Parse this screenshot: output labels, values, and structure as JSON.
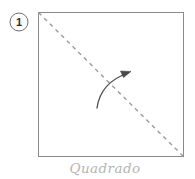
{
  "diagram": {
    "title": "Quadrado",
    "step_number": "1",
    "caption": "Quadrado",
    "type": "origami-fold-instruction",
    "colors": {
      "paper_outline": "#8a8a8a",
      "fold_line": "#9a9a9a",
      "arrow": "#4a4a4a",
      "badge_outline": "#6f6f6f",
      "badge_number": "#2e2e2e",
      "caption": "#b4b4b4",
      "background": "#ffffff"
    },
    "shape": {
      "name": "square",
      "left": 38,
      "top": 12,
      "right": 184,
      "bottom": 157,
      "width": 146,
      "height": 145
    },
    "fold_line": {
      "style": "dashed",
      "dash_pattern": "4 4",
      "from_x": 38,
      "from_y": 12,
      "to_x": 184,
      "to_y": 157,
      "label": "valley-fold-diagonal"
    },
    "fold_arrow": {
      "direction": "up-right",
      "start_x": 97,
      "start_y": 108,
      "end_x": 130,
      "end_y": 72,
      "label": "fold-direction-arrow"
    },
    "badge": {
      "center_x": 19,
      "center_y": 22,
      "radius": 9
    },
    "caption_position": {
      "x": 105,
      "y": 172
    }
  }
}
